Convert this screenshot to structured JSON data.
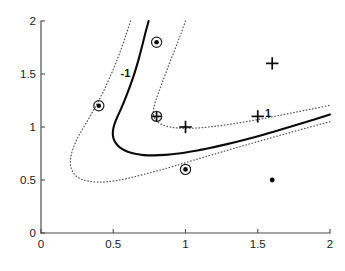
{
  "figure": {
    "title": "",
    "background": "#ffffff"
  },
  "axes": {
    "x": {
      "label": "",
      "min": 0,
      "max": 2,
      "ticks": [
        0,
        0.5,
        1,
        1.5,
        2
      ],
      "tick_labels": [
        "0",
        "0.5",
        "1",
        "1.5",
        "2"
      ]
    },
    "y": {
      "label": "",
      "min": 0,
      "max": 2,
      "ticks": [
        0,
        0.5,
        1,
        1.5,
        2
      ],
      "tick_labels": [
        "0",
        "0.5",
        "1",
        "1.5",
        "2"
      ]
    }
  },
  "annotations": [
    {
      "text": "-1",
      "x": 0.55,
      "y": 1.47,
      "name": "contour-label-minus-one"
    },
    {
      "text": "1",
      "x": 1.55,
      "y": 1.09,
      "name": "contour-label-plus-one"
    }
  ],
  "colors": {
    "boundary": "#0a0a0a",
    "margin": "#555555",
    "marker": "#0a0a0a",
    "axis": "#4a4a4a"
  },
  "chart_data": {
    "type": "scatter",
    "title": "",
    "xlabel": "",
    "ylabel": "",
    "xlim": [
      0,
      2
    ],
    "ylim": [
      0,
      2
    ],
    "grid": false,
    "legend": "none",
    "series": [
      {
        "name": "class -1 support vectors",
        "marker": "circled-dot",
        "points": [
          {
            "x": 0.4,
            "y": 1.2
          },
          {
            "x": 0.8,
            "y": 1.8
          },
          {
            "x": 1.0,
            "y": 0.6
          }
        ]
      },
      {
        "name": "class -1 points",
        "marker": "dot",
        "points": [
          {
            "x": 1.6,
            "y": 0.5
          }
        ]
      },
      {
        "name": "class +1 support vectors",
        "marker": "circled-plus",
        "points": [
          {
            "x": 0.8,
            "y": 1.1
          }
        ]
      },
      {
        "name": "class +1 points",
        "marker": "plus",
        "points": [
          {
            "x": 1.0,
            "y": 1.0
          },
          {
            "x": 1.5,
            "y": 1.1
          },
          {
            "x": 1.6,
            "y": 1.6
          }
        ]
      }
    ],
    "contours": [
      {
        "name": "decision boundary",
        "level": 0,
        "style": "solid",
        "points": [
          [
            0.745,
            2.0
          ],
          [
            0.725,
            1.9
          ],
          [
            0.703,
            1.78
          ],
          [
            0.678,
            1.65
          ],
          [
            0.65,
            1.52
          ],
          [
            0.62,
            1.4
          ],
          [
            0.588,
            1.285
          ],
          [
            0.558,
            1.185
          ],
          [
            0.53,
            1.1
          ],
          [
            0.508,
            1.025
          ],
          [
            0.498,
            0.965
          ],
          [
            0.498,
            0.915
          ],
          [
            0.508,
            0.87
          ],
          [
            0.528,
            0.83
          ],
          [
            0.558,
            0.795
          ],
          [
            0.6,
            0.767
          ],
          [
            0.65,
            0.748
          ],
          [
            0.71,
            0.735
          ],
          [
            0.78,
            0.732
          ],
          [
            0.86,
            0.737
          ],
          [
            0.95,
            0.75
          ],
          [
            1.05,
            0.772
          ],
          [
            1.16,
            0.8
          ],
          [
            1.28,
            0.836
          ],
          [
            1.41,
            0.88
          ],
          [
            1.545,
            0.93
          ],
          [
            1.69,
            0.988
          ],
          [
            1.84,
            1.05
          ],
          [
            2.0,
            1.118
          ]
        ]
      },
      {
        "name": "margin minus one",
        "level": -1,
        "style": "dotted",
        "points": [
          [
            0.62,
            2.0
          ],
          [
            0.59,
            1.875
          ],
          [
            0.557,
            1.745
          ],
          [
            0.52,
            1.61
          ],
          [
            0.478,
            1.475
          ],
          [
            0.435,
            1.345
          ],
          [
            0.39,
            1.225
          ],
          [
            0.345,
            1.115
          ],
          [
            0.305,
            1.02
          ],
          [
            0.268,
            0.935
          ],
          [
            0.24,
            0.858
          ],
          [
            0.22,
            0.79
          ],
          [
            0.208,
            0.73
          ],
          [
            0.203,
            0.672
          ],
          [
            0.208,
            0.618
          ],
          [
            0.222,
            0.572
          ],
          [
            0.248,
            0.533
          ],
          [
            0.285,
            0.505
          ],
          [
            0.333,
            0.488
          ],
          [
            0.39,
            0.48
          ],
          [
            0.455,
            0.483
          ],
          [
            0.53,
            0.497
          ],
          [
            0.615,
            0.52
          ],
          [
            0.71,
            0.552
          ],
          [
            0.815,
            0.59
          ],
          [
            0.93,
            0.635
          ],
          [
            1.055,
            0.686
          ],
          [
            1.19,
            0.74
          ],
          [
            1.335,
            0.798
          ],
          [
            1.49,
            0.858
          ],
          [
            1.655,
            0.922
          ],
          [
            1.825,
            0.986
          ],
          [
            2.0,
            1.05
          ]
        ]
      },
      {
        "name": "margin plus one",
        "level": 1,
        "style": "dotted",
        "points": [
          [
            1.0,
            2.0
          ],
          [
            0.968,
            1.88
          ],
          [
            0.935,
            1.76
          ],
          [
            0.9,
            1.64
          ],
          [
            0.868,
            1.525
          ],
          [
            0.838,
            1.415
          ],
          [
            0.812,
            1.32
          ],
          [
            0.792,
            1.24
          ],
          [
            0.78,
            1.175
          ],
          [
            0.778,
            1.122
          ],
          [
            0.788,
            1.078
          ],
          [
            0.81,
            1.043
          ],
          [
            0.845,
            1.018
          ],
          [
            0.893,
            1.0
          ],
          [
            0.952,
            0.99
          ],
          [
            1.022,
            0.988
          ],
          [
            1.102,
            0.993
          ],
          [
            1.192,
            1.005
          ],
          [
            1.29,
            1.022
          ],
          [
            1.395,
            1.045
          ],
          [
            1.508,
            1.072
          ],
          [
            1.628,
            1.103
          ],
          [
            1.755,
            1.138
          ],
          [
            1.88,
            1.172
          ],
          [
            2.0,
            1.205
          ]
        ]
      }
    ]
  }
}
